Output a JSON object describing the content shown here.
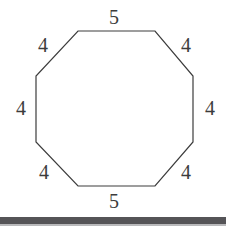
{
  "figure": {
    "shape_name": "octagon",
    "stroke_color": "#3c3c3c",
    "fill_color": "#ffffff",
    "stroke_width": 1.2,
    "vertices": [
      [
        78,
        31
      ],
      [
        155,
        31
      ],
      [
        193,
        76
      ],
      [
        193,
        142
      ],
      [
        155,
        186
      ],
      [
        78,
        186
      ],
      [
        36,
        142
      ],
      [
        36,
        76
      ]
    ],
    "labels": [
      {
        "id": "top",
        "text": "5",
        "x": 114,
        "y": 17
      },
      {
        "id": "upper-right",
        "text": "4",
        "x": 186,
        "y": 45
      },
      {
        "id": "right",
        "text": "4",
        "x": 210,
        "y": 108
      },
      {
        "id": "lower-right",
        "text": "4",
        "x": 186,
        "y": 172
      },
      {
        "id": "bottom",
        "text": "5",
        "x": 114,
        "y": 201
      },
      {
        "id": "lower-left",
        "text": "4",
        "x": 44,
        "y": 172
      },
      {
        "id": "left",
        "text": "4",
        "x": 21,
        "y": 108
      },
      {
        "id": "upper-left",
        "text": "4",
        "x": 43,
        "y": 45
      }
    ]
  },
  "scan_artifact": {
    "bar_color": "#555457",
    "bar_top": 217,
    "bar_height": 7,
    "edge_color": "#b9b9bb",
    "edge_top": 224,
    "edge_height": 2
  }
}
